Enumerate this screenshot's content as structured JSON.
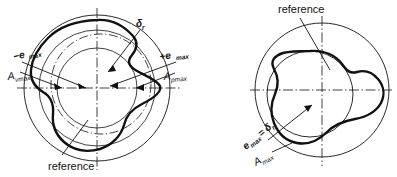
{
  "figure": {
    "type": "technical-diagram",
    "background_color": "#ffffff",
    "line_color": "#111111"
  },
  "left_diagram": {
    "name": "eccentric-roundness-chart",
    "center": {
      "x": 97,
      "y": 88
    },
    "circles": [
      {
        "name": "outer-circle",
        "r": 73,
        "style": "thin"
      },
      {
        "name": "middle-circle",
        "r": 58,
        "style": "thin"
      },
      {
        "name": "inner-circle",
        "r": 40,
        "style": "thin"
      },
      {
        "name": "reference-circle",
        "r": 50,
        "style": "dash-dot",
        "cx": 101,
        "cy": 84
      }
    ],
    "labels": {
      "minus_e_max": {
        "sym": "−e",
        "sub": "max"
      },
      "a_vmax": {
        "sym": "A",
        "sub": "vmax"
      },
      "plus_e_max": {
        "sym": "+e",
        "sub": "max"
      },
      "a_pmax": {
        "sym": "A",
        "sub": "pmax"
      },
      "delta_r": {
        "sym": "δ",
        "sub": "r"
      },
      "reference": "reference"
    }
  },
  "right_diagram": {
    "name": "concentric-roundness-chart",
    "center": {
      "x": 322,
      "y": 90
    },
    "circles": [
      {
        "name": "outer-circle",
        "r": 67,
        "style": "thin"
      },
      {
        "name": "inner-circle",
        "r": 43,
        "style": "thin",
        "cx": 310,
        "cy": 94
      }
    ],
    "labels": {
      "reference": "reference",
      "e_max_equals_delta_r": {
        "sym": "e",
        "sub": "max",
        "eq": "=",
        "sym2": "δ",
        "sub2": "r"
      },
      "a_max": {
        "sym": "A",
        "sub": "max"
      }
    }
  }
}
